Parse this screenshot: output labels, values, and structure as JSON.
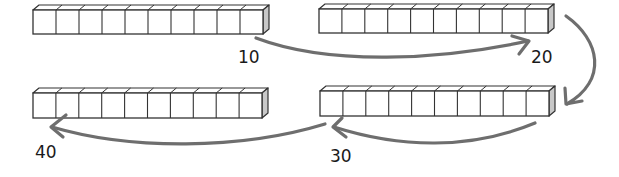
{
  "diagram": {
    "rods": [
      {
        "id": "rod-1",
        "cubes": 10,
        "x": 33,
        "y": 10,
        "w": 230,
        "h": 24
      },
      {
        "id": "rod-2",
        "cubes": 10,
        "x": 319,
        "y": 9,
        "w": 229,
        "h": 24
      },
      {
        "id": "rod-3",
        "cubes": 10,
        "x": 33,
        "y": 93,
        "w": 229,
        "h": 25
      },
      {
        "id": "rod-4",
        "cubes": 10,
        "x": 320,
        "y": 91,
        "w": 229,
        "h": 25
      }
    ],
    "labels": [
      {
        "text": "10",
        "x": 238,
        "y": 47
      },
      {
        "text": "20",
        "x": 531,
        "y": 47
      },
      {
        "text": "30",
        "x": 330,
        "y": 146
      },
      {
        "text": "40",
        "x": 35,
        "y": 142
      }
    ],
    "colors": {
      "rod_stroke": "#333333",
      "rod_fill": "#ffffff",
      "rod_side": "#c8c8c8",
      "arrow": "#6e6e6e",
      "label": "#1a1a1a"
    }
  }
}
